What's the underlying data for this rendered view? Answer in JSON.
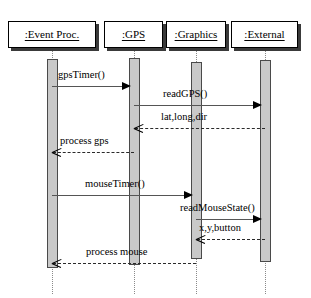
{
  "diagram": {
    "type": "uml-sequence-diagram",
    "width": 311,
    "height": 298,
    "background": "#ffffff",
    "activation_fill": "#c9c9c9",
    "line_color": "#555555"
  },
  "objects": [
    {
      "id": "event-proc",
      "label": ":Event Proc.",
      "box": {
        "x": 8,
        "y": 21,
        "w": 88,
        "h": 27
      },
      "lifeline_x": 52
    },
    {
      "id": "gps",
      "label": ":GPS",
      "box": {
        "x": 104,
        "y": 21,
        "w": 59,
        "h": 27
      },
      "lifeline_x": 134
    },
    {
      "id": "graphics",
      "label": ":Graphics",
      "box": {
        "x": 166,
        "y": 21,
        "w": 60,
        "h": 27
      },
      "lifeline_x": 196
    },
    {
      "id": "external",
      "label": ":External",
      "box": {
        "x": 231,
        "y": 21,
        "w": 67,
        "h": 27
      },
      "lifeline_x": 265
    }
  ],
  "activations": [
    {
      "owner": "event-proc",
      "x": 47,
      "y": 59,
      "w": 11,
      "h": 209
    },
    {
      "owner": "gps",
      "x": 129,
      "y": 58,
      "w": 11,
      "h": 207
    },
    {
      "owner": "graphics",
      "x": 191,
      "y": 62,
      "w": 11,
      "h": 197
    },
    {
      "owner": "external",
      "x": 260,
      "y": 60,
      "w": 11,
      "h": 202
    }
  ],
  "messages": [
    {
      "id": "m1",
      "label": "gpsTimer()",
      "from": "event-proc",
      "to": "gps",
      "x1": 52,
      "x2": 130,
      "y": 86,
      "style": "solid",
      "direction": "right",
      "label_x": 58,
      "label_y": 70
    },
    {
      "id": "m2",
      "label": "readGPS()",
      "from": "gps",
      "to": "external",
      "x1": 134,
      "x2": 261,
      "y": 105,
      "style": "solid",
      "direction": "right",
      "label_x": 163,
      "label_y": 89
    },
    {
      "id": "m3",
      "label": "lat,long,dir",
      "from": "external",
      "to": "gps",
      "x1": 135,
      "x2": 265,
      "y": 128,
      "style": "dashed",
      "direction": "left",
      "label_x": 161,
      "label_y": 112
    },
    {
      "id": "m4",
      "label": "process gps",
      "from": "gps",
      "to": "event-proc",
      "x1": 53,
      "x2": 134,
      "y": 152,
      "style": "dashed",
      "direction": "left",
      "label_x": 60,
      "label_y": 136
    },
    {
      "id": "m5",
      "label": "mouseTimer()",
      "from": "event-proc",
      "to": "graphics",
      "x1": 52,
      "x2": 192,
      "y": 195,
      "style": "solid",
      "direction": "right",
      "label_x": 85,
      "label_y": 179
    },
    {
      "id": "m6",
      "label": "readMouseState()",
      "from": "graphics",
      "to": "external",
      "x1": 196,
      "x2": 261,
      "y": 219,
      "style": "solid",
      "direction": "right",
      "label_x": 180,
      "label_y": 203
    },
    {
      "id": "m7",
      "label": "x,y,button",
      "from": "external",
      "to": "graphics",
      "x1": 197,
      "x2": 265,
      "y": 239,
      "style": "dashed",
      "direction": "left",
      "label_x": 199,
      "label_y": 223
    },
    {
      "id": "m8",
      "label": "process mouse",
      "from": "graphics",
      "to": "event-proc",
      "x1": 53,
      "x2": 196,
      "y": 263,
      "style": "dashed",
      "direction": "left",
      "label_x": 86,
      "label_y": 247
    }
  ]
}
